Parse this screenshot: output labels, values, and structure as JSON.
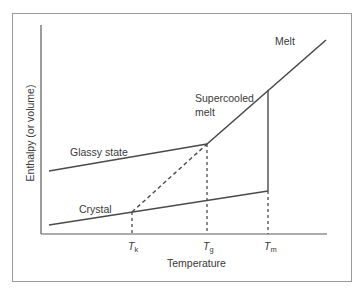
{
  "diagram": {
    "type": "phase-diagram",
    "axes": {
      "x_label": "Temperature",
      "y_label": "Enthalpy (or volume)"
    },
    "curve_labels": {
      "melt": "Melt",
      "supercooled_1": "Supercooled",
      "supercooled_2": "melt",
      "glassy": "Glassy state",
      "crystal": "Crystal"
    },
    "ticks": [
      {
        "symbol": "T",
        "sub": "k"
      },
      {
        "symbol": "T",
        "sub": "g"
      },
      {
        "symbol": "T",
        "sub": "m"
      }
    ],
    "colors": {
      "line": "#4a4a4a",
      "frame": "#9a9a9a",
      "text": "#3a3a3a"
    }
  }
}
